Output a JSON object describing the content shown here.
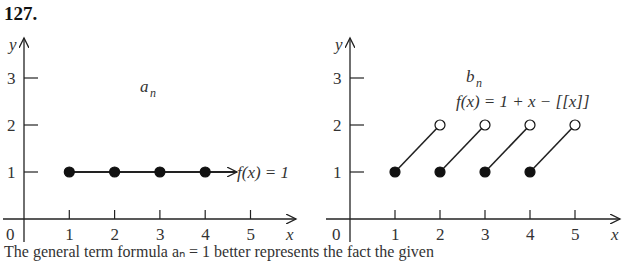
{
  "problem_number": "127.",
  "caption": "The general term formula aₙ = 1 better represents the fact the given",
  "colors": {
    "ink": "#222222",
    "background": "#ffffff"
  },
  "chart_data": [
    {
      "type": "scatter",
      "title": "a_n",
      "label_sequence": "a",
      "label_subscript": "n",
      "function_label": "f(x) = 1",
      "xlabel": "x",
      "ylabel": "y",
      "origin_label": "0",
      "x_ticks": [
        "1",
        "2",
        "3",
        "4",
        "5"
      ],
      "y_ticks": [
        "1",
        "2",
        "3"
      ],
      "xlim": [
        0,
        5.5
      ],
      "ylim": [
        0,
        3.5
      ],
      "points": [
        {
          "x": 1,
          "y": 1,
          "filled": true
        },
        {
          "x": 2,
          "y": 1,
          "filled": true
        },
        {
          "x": 3,
          "y": 1,
          "filled": true
        },
        {
          "x": 4,
          "y": 1,
          "filled": true
        }
      ],
      "line": {
        "from": [
          1,
          1
        ],
        "to": [
          4.7,
          1
        ],
        "arrow": true
      },
      "grid": false
    },
    {
      "type": "line",
      "title": "b_n",
      "label_sequence": "b",
      "label_subscript": "n",
      "function_label": "f(x) = 1 + x − [[x]]",
      "xlabel": "x",
      "ylabel": "y",
      "origin_label": "0",
      "x_ticks": [
        "1",
        "2",
        "3",
        "4",
        "5"
      ],
      "y_ticks": [
        "1",
        "2",
        "3"
      ],
      "xlim": [
        0,
        5.5
      ],
      "ylim": [
        0,
        3.5
      ],
      "segments": [
        {
          "start": {
            "x": 1,
            "y": 1,
            "filled": true
          },
          "end": {
            "x": 2,
            "y": 2,
            "filled": false
          }
        },
        {
          "start": {
            "x": 2,
            "y": 1,
            "filled": true
          },
          "end": {
            "x": 3,
            "y": 2,
            "filled": false
          }
        },
        {
          "start": {
            "x": 3,
            "y": 1,
            "filled": true
          },
          "end": {
            "x": 4,
            "y": 2,
            "filled": false
          }
        },
        {
          "start": {
            "x": 4,
            "y": 1,
            "filled": true
          },
          "end": {
            "x": 5,
            "y": 2,
            "filled": false
          }
        }
      ],
      "grid": false
    }
  ]
}
